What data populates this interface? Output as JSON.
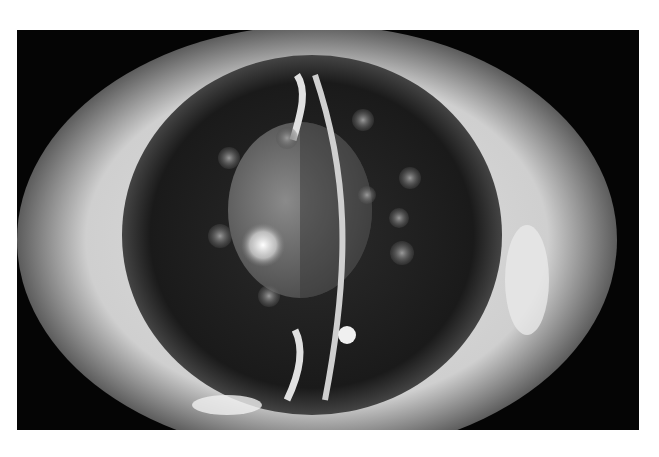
{
  "image": {
    "subject": "Slit-lamp photograph of an eye",
    "mode": "grayscale",
    "colors": {
      "background": "#ffffff",
      "frame": "#050505",
      "sclera": "#d9d9d9",
      "iris_dark": "#1a1a1a",
      "lens": "#6e6e6e",
      "highlight": "#f5f5f5"
    }
  }
}
